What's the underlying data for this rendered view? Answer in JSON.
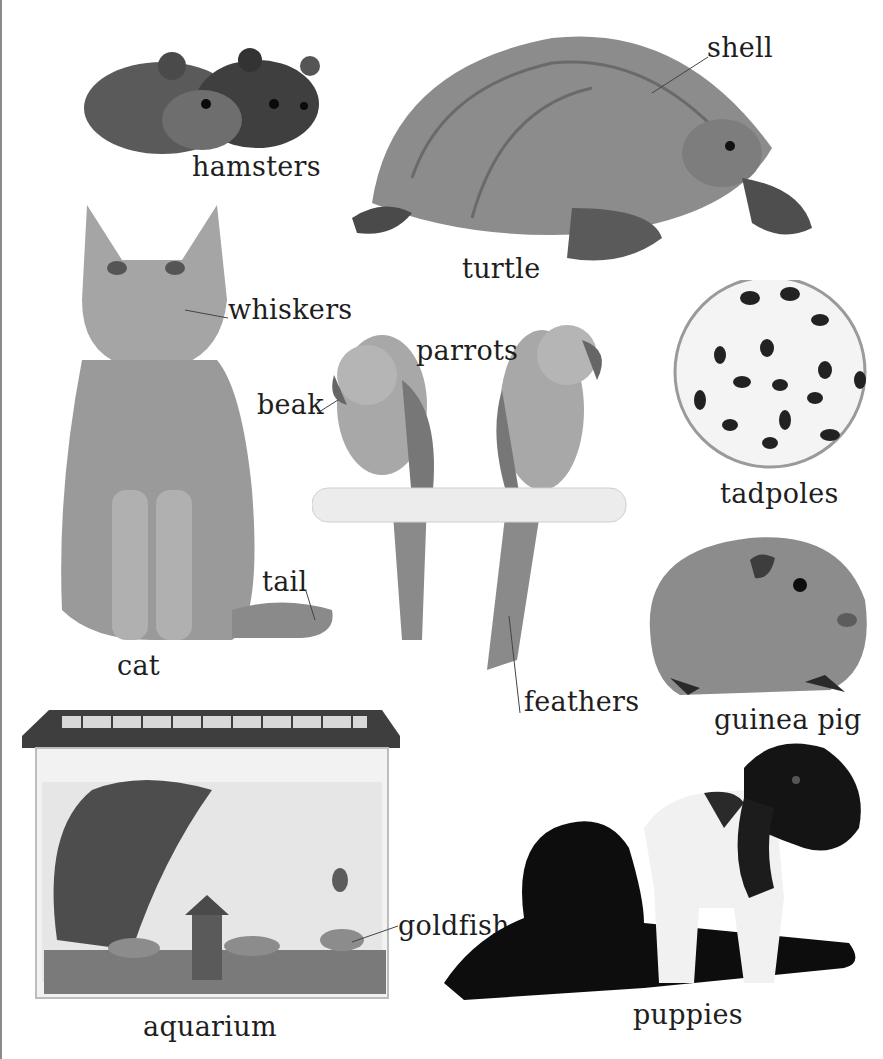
{
  "page": {
    "type": "picture-book spread",
    "palette": {
      "background": "#ffffff",
      "text": "#1e1e1e",
      "leader": "#444444"
    }
  },
  "items": {
    "hamsters": {
      "label": "hamsters"
    },
    "turtle": {
      "label": "turtle",
      "parts": {
        "shell": "shell"
      }
    },
    "cat": {
      "label": "cat",
      "parts": {
        "whiskers": "whiskers",
        "tail": "tail"
      }
    },
    "parrots": {
      "label": "parrots",
      "parts": {
        "beak": "beak",
        "feathers": "feathers"
      }
    },
    "tadpoles": {
      "label": "tadpoles"
    },
    "guinea_pig": {
      "label": "guinea pig"
    },
    "aquarium": {
      "label": "aquarium",
      "parts": {
        "goldfish": "goldfish"
      }
    },
    "puppies": {
      "label": "puppies"
    }
  }
}
